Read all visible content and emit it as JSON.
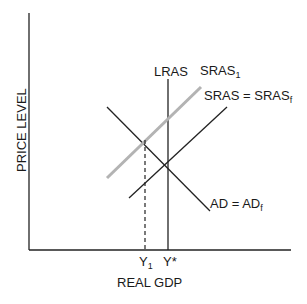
{
  "diagram": {
    "type": "AD-AS model",
    "axes": {
      "xlabel": "REAL GDP",
      "ylabel": "PRICE LEVEL"
    },
    "curves": {
      "lras": {
        "label": "LRAS"
      },
      "sras1": {
        "label": "SRAS",
        "subscript": "1",
        "color": "#b3b3b3"
      },
      "sras_f": {
        "label": "SRAS = SRAS",
        "subscript": "f"
      },
      "ad": {
        "label": "AD = AD",
        "subscript": "f"
      }
    },
    "x_ticks": {
      "y1": {
        "label": "Y",
        "subscript": "1"
      },
      "ystar": {
        "label": "Y*"
      }
    }
  }
}
